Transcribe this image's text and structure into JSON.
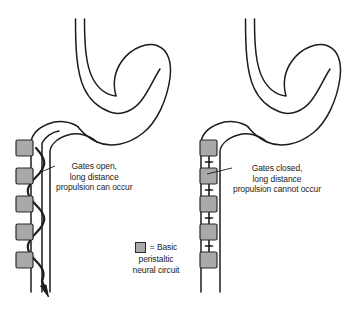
{
  "figure": {
    "background_color": "#ffffff",
    "line_color": "#1c1c1c",
    "node_fill_color": "#a9a9a9",
    "node_stroke_color": "#2b2b2b"
  },
  "panels": [
    {
      "id": "left",
      "state": "gates-open",
      "organ": "stomach-and-duodenum",
      "node_count": 5,
      "connector": "continuous-serpentine",
      "arrow": "downward-propulsion-arrow",
      "label": {
        "line1": "Gates open,",
        "line2": "long distance",
        "line3": "propulsion can occur"
      }
    },
    {
      "id": "right",
      "state": "gates-closed",
      "organ": "stomach-and-duodenum",
      "node_count": 5,
      "connector": "segmented-blocked",
      "arrow": "none",
      "label": {
        "line1": "Gates closed,",
        "line2": "long distance",
        "line3": "propulsion cannot occur"
      }
    }
  ],
  "legend": {
    "equals": "= Basic",
    "line2": "peristaltic",
    "line3": "neural circuit",
    "swatch_color": "#a9a9a9"
  }
}
